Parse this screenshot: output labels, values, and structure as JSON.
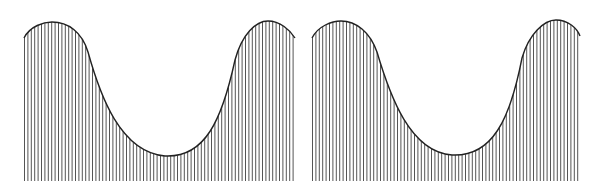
{
  "figure": {
    "panels": [
      {
        "id": "left",
        "x0": 24,
        "x1": 295,
        "baseline": 181,
        "curve": "M24,38 C30,26 44,22 52,22 C68,22 82,32 88,52 C100,95 120,152 165,156 C205,158 222,120 235,60 C242,34 256,21 268,21 C280,21 290,30 295,38",
        "hatch_spacing": 3.4,
        "hatch_color": "#555555",
        "outline_color": "#222222"
      },
      {
        "id": "right",
        "x0": 312,
        "x1": 580,
        "baseline": 181,
        "curve": "M312,38 C318,26 332,21 341,21 C356,21 370,32 377,52 C390,96 410,152 452,155 C492,157 510,120 522,58 C529,34 544,20 556,20 C568,20 577,28 580,36",
        "hatch_spacing": 3.4,
        "hatch_color": "#555555",
        "outline_color": "#222222"
      }
    ]
  }
}
